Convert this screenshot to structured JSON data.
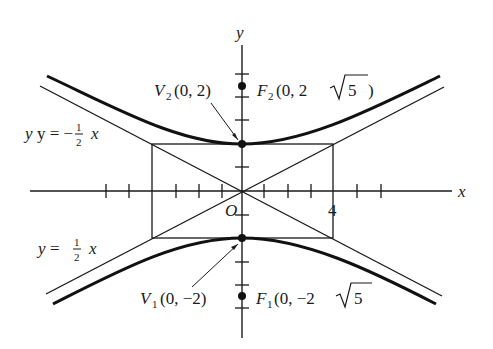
{
  "diagram": {
    "axes": {
      "x_label": "x",
      "y_label": "y",
      "origin_label": "O",
      "x_tick_label": "4"
    },
    "vertices": [
      {
        "name": "V",
        "sub": "2",
        "coords": "(0, 2)"
      },
      {
        "name": "V",
        "sub": "1",
        "coords": "(0, −2)"
      }
    ],
    "foci": [
      {
        "name": "F",
        "sub": "2",
        "pre": "(0, 2",
        "rad": "5",
        "post": " )"
      },
      {
        "name": "F",
        "sub": "1",
        "pre": "(0, −2",
        "rad": "5",
        "post": ""
      }
    ],
    "asymptotes": [
      {
        "lhs": "y = −",
        "num": "1",
        "den": "2",
        "rhs": "x"
      },
      {
        "lhs": "y = ",
        "num": "1",
        "den": "2",
        "rhs": "x"
      }
    ],
    "colors": {
      "ink": "#1a1a1a",
      "background": "#ffffff"
    }
  }
}
